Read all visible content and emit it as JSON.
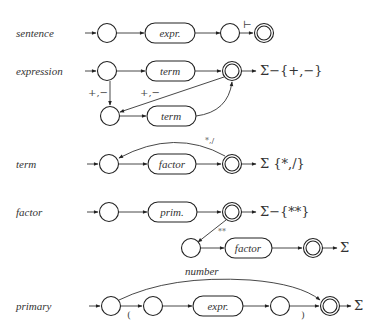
{
  "diagram": {
    "rows": [
      {
        "name": "sentence",
        "label": "sentence",
        "boxes": [
          "expr."
        ],
        "edge_labels": [
          "⊢"
        ],
        "exit": ""
      },
      {
        "name": "expression",
        "label": "expression",
        "boxes": [
          "term",
          "term"
        ],
        "edge_labels": [
          "+,−",
          "+,−"
        ],
        "exit": "Σ−{+,−}"
      },
      {
        "name": "term",
        "label": "term",
        "boxes": [
          "factor"
        ],
        "edge_labels": [
          "*,/"
        ],
        "exit": "Σ {*,/}"
      },
      {
        "name": "factor",
        "label": "factor",
        "boxes": [
          "prim.",
          "factor"
        ],
        "edge_labels": [
          "**"
        ],
        "exit": "Σ−{**}",
        "exit2": "Σ"
      },
      {
        "name": "primary",
        "label": "primary",
        "boxes": [
          "expr."
        ],
        "edge_labels": [
          "number",
          "(",
          ")"
        ],
        "exit": "Σ"
      }
    ]
  }
}
